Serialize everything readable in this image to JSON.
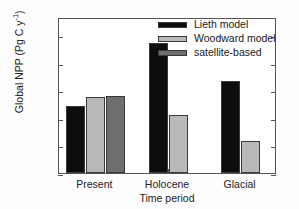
{
  "chart_data": {
    "type": "bar",
    "title": "",
    "xlabel": "Time period",
    "ylabel": "Global NPP (Pg C y",
    "ylabel_sup": "-1",
    "ylabel_suffix": ")",
    "categories": [
      "Present",
      "Holocene",
      "Glacial"
    ],
    "series": [
      {
        "name": "Lieth model",
        "color": "#0d0d0d",
        "values": [
          48.5,
          94.0,
          67.0
        ]
      },
      {
        "name": "Woodward model",
        "color": "#b9b9b9",
        "values": [
          55.0,
          42.0,
          23.5
        ]
      },
      {
        "name": "satellite-based",
        "color": "#6e6e6e",
        "values": [
          56.0,
          null,
          null
        ]
      }
    ],
    "ylim": [
      0,
      113
    ],
    "yticks": [
      0,
      20,
      40,
      60,
      80,
      100
    ],
    "ytick_labels": [
      "0",
      "20",
      "40",
      "60",
      "80",
      "100"
    ],
    "grid": false,
    "legend_position": "top-right",
    "frame": true,
    "axis_color": "#555555"
  },
  "legend": {
    "entries": [
      {
        "label": "Lieth model"
      },
      {
        "label": "Woodward model"
      },
      {
        "label": "satellite-based"
      }
    ]
  }
}
